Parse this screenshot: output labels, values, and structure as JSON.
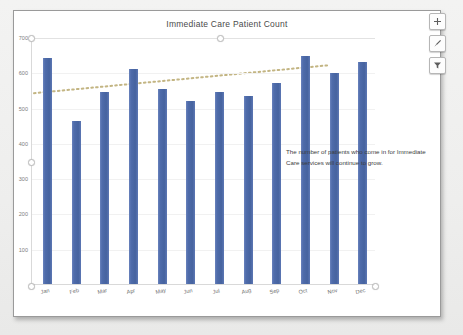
{
  "chart_data": {
    "type": "bar",
    "title": "Immediate Care Patient Count",
    "xlabel": "",
    "ylabel": "",
    "categories": [
      "Jan",
      "Feb",
      "Mar",
      "Apr",
      "May",
      "Jun",
      "Jul",
      "Aug",
      "Sep",
      "Oct",
      "Nov",
      "Dec"
    ],
    "values": [
      640,
      462,
      545,
      608,
      553,
      520,
      545,
      533,
      570,
      645,
      597,
      628
    ],
    "series": [
      {
        "name": "Patient Count",
        "values": [
          640,
          462,
          545,
          608,
          553,
          520,
          545,
          533,
          570,
          645,
          597,
          628
        ],
        "color": "#4f6cab"
      },
      {
        "name": "Linear trendline",
        "type": "line",
        "style": "dotted",
        "color": "#c3b583",
        "start_value": 543,
        "end_value": 622
      }
    ],
    "ylim": [
      0,
      700
    ],
    "yticks": [
      100,
      200,
      300,
      400,
      500,
      600,
      700
    ],
    "ytick_labels": [
      "100",
      "200",
      "300",
      "400",
      "500",
      "600",
      "700"
    ],
    "grid": true,
    "legend": "none",
    "annotations": [
      {
        "text": "The number of patients who come in for Immediate Care services will continue to grow."
      }
    ]
  },
  "chart": {
    "title": "Immediate Care Patient Count",
    "annotation_text": "The number of patients who come in for Immediate Care services will continue to grow."
  },
  "buttons": [
    {
      "name": "chart-elements",
      "label": "+"
    },
    {
      "name": "chart-styles",
      "label": "brush"
    },
    {
      "name": "chart-filters",
      "label": "filter"
    }
  ]
}
